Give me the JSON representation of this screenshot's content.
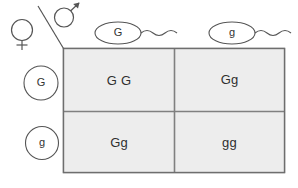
{
  "diagram": {
    "type": "punnett-square",
    "symbols": {
      "female": "♀",
      "female_name": "female-symbol",
      "male": "♂",
      "male_name": "male-symbol"
    },
    "sperm_gametes": [
      {
        "label": "G",
        "name": "sperm-gamete-G"
      },
      {
        "label": "g",
        "name": "sperm-gamete-g"
      }
    ],
    "egg_gametes": [
      {
        "label": "G",
        "name": "egg-gamete-G"
      },
      {
        "label": "g",
        "name": "egg-gamete-g"
      }
    ],
    "grid": {
      "columns": [
        "G",
        "g"
      ],
      "rows": [
        "G",
        "g"
      ],
      "cells": [
        {
          "label": "G G",
          "name": "punnett-cell-row1-col1"
        },
        {
          "label": "Gg",
          "name": "punnett-cell-row1-col2"
        },
        {
          "label": "Gg",
          "name": "punnett-cell-row2-col1"
        },
        {
          "label": "gg",
          "name": "punnett-cell-row2-col2"
        }
      ]
    }
  },
  "colors": {
    "cell_fill": "#ededed",
    "grid_line": "#808080",
    "grid_border": "#6e6e6e",
    "outline": "#5a5a5a",
    "text": "#2f2f2f",
    "background": "#ffffff"
  }
}
